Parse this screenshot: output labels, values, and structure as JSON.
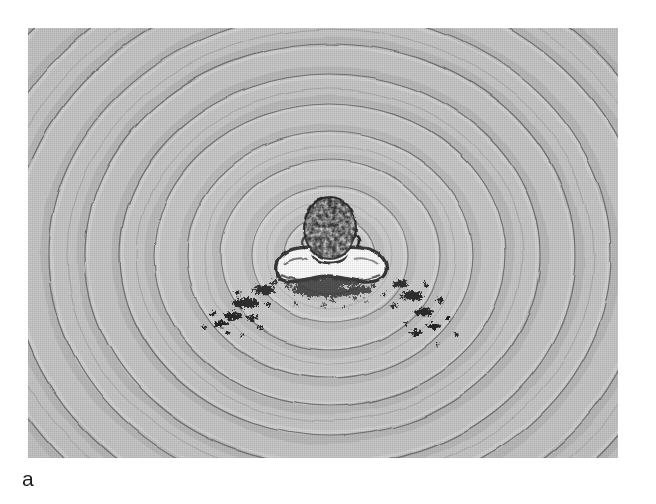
{
  "figure": {
    "panel_label": "a",
    "scene_description": "Overhead photograph of a person's head and shoulders at the surface of water, surrounded by concentric circular ripple waves radiating outward",
    "subject": {
      "name": "swimmer-head-and-shoulders",
      "head_fill": "#1a1a1a",
      "shoulder_fill": "#ffffff",
      "outline": "#111111"
    },
    "plate": {
      "x": 28,
      "y": 28,
      "width": 590,
      "height": 430,
      "background_color": "#c9c9c9",
      "border_color": "#b9b9b9"
    },
    "ripples": {
      "center_x": 302,
      "center_y": 227,
      "stroke_color": "#6f6f6f",
      "stroke_width": 1.15,
      "count": 11,
      "radii": [
        46,
        78,
        110,
        143,
        176,
        210,
        245,
        281,
        318,
        356,
        396
      ],
      "ellipse_ratio": 0.86
    },
    "splashes": {
      "name": "water-droplet-splash-marks",
      "color": "#161616",
      "count": 2,
      "sides": [
        "lower-left",
        "lower-right"
      ]
    },
    "page_background": "#ffffff"
  }
}
